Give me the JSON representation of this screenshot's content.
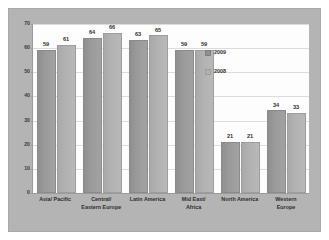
{
  "chart_data": {
    "type": "bar",
    "title": "",
    "subtitle": "",
    "xlabel": "",
    "ylabel": "",
    "ylim": [
      0,
      70
    ],
    "yticks": [
      0,
      10,
      20,
      30,
      40,
      50,
      60,
      70
    ],
    "grid": true,
    "legend_position": "inside-upper-right",
    "categories": [
      "Asia/ Pacific",
      "Central/ Eastern Europe",
      "Latin America",
      "Mid East/ Africa",
      "North America",
      "Western Europe"
    ],
    "category_lines": [
      [
        "Asia/ Pacific"
      ],
      [
        "Central/",
        "Eastern Europe"
      ],
      [
        "Latin America"
      ],
      [
        "Mid East/",
        "Africa"
      ],
      [
        "North America"
      ],
      [
        "Western",
        "Europe"
      ]
    ],
    "series": [
      {
        "name": "2009",
        "color": "#8f8f8f",
        "values": [
          59,
          64,
          63,
          59,
          21,
          34
        ]
      },
      {
        "name": "2008",
        "color": "#b0b0b0",
        "values": [
          61,
          66,
          65,
          59,
          21,
          33
        ]
      }
    ]
  },
  "legend": {
    "items": [
      {
        "label": "2009",
        "swatch": "s2009"
      },
      {
        "label": "2008",
        "swatch": "s2008"
      }
    ]
  },
  "axis": {
    "y_tick_labels": [
      "70",
      "60",
      "50",
      "40",
      "30",
      "20",
      "10",
      "0"
    ]
  }
}
